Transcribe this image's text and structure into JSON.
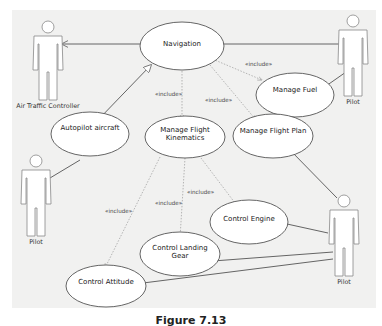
{
  "diagram": {
    "type": "uml-use-case",
    "actors": [
      {
        "id": "atc",
        "label": "Air Traffic Controller"
      },
      {
        "id": "pilot_top",
        "label": "Pilot"
      },
      {
        "id": "pilot_left",
        "label": "Pilot"
      },
      {
        "id": "pilot_bottom",
        "label": "Pilot"
      }
    ],
    "use_cases": [
      {
        "id": "navigation",
        "label": "Navigation"
      },
      {
        "id": "manage_fuel",
        "label": "Manage Fuel"
      },
      {
        "id": "autopilot",
        "label": "Autopilot aircraft"
      },
      {
        "id": "manage_flight_kinematics",
        "label_line1": "Manage Flight",
        "label_line2": "Kinematics"
      },
      {
        "id": "manage_flight_plan",
        "label": "Manage Flight Plan"
      },
      {
        "id": "control_engine",
        "label": "Control Engine"
      },
      {
        "id": "control_landing_gear",
        "label_line1": "Control Landing",
        "label_line2": "Gear"
      },
      {
        "id": "control_attitude",
        "label": "Control Attitude"
      }
    ],
    "relationships": [
      {
        "from": "navigation",
        "to": "atc",
        "type": "association-arrow"
      },
      {
        "from": "navigation",
        "to": "pilot_top",
        "type": "association"
      },
      {
        "from": "manage_fuel",
        "to": "pilot_top",
        "type": "association"
      },
      {
        "from": "autopilot",
        "to": "navigation",
        "type": "generalization"
      },
      {
        "from": "autopilot",
        "to": "pilot_left",
        "type": "association"
      },
      {
        "from": "navigation",
        "to": "manage_fuel",
        "type": "include",
        "label": "«include»"
      },
      {
        "from": "navigation",
        "to": "manage_flight_kinematics",
        "type": "include",
        "label": "«include»"
      },
      {
        "from": "navigation",
        "to": "manage_flight_plan",
        "type": "include",
        "label": "«include»"
      },
      {
        "from": "manage_flight_plan",
        "to": "pilot_bottom",
        "type": "association"
      },
      {
        "from": "manage_flight_kinematics",
        "to": "control_engine",
        "type": "include",
        "label": "«include»"
      },
      {
        "from": "manage_flight_kinematics",
        "to": "control_landing_gear",
        "type": "include",
        "label": "«include»"
      },
      {
        "from": "manage_flight_kinematics",
        "to": "control_attitude",
        "type": "include",
        "label": "«include»"
      },
      {
        "from": "control_engine",
        "to": "pilot_bottom",
        "type": "association"
      },
      {
        "from": "control_landing_gear",
        "to": "pilot_bottom",
        "type": "association"
      },
      {
        "from": "control_attitude",
        "to": "pilot_bottom",
        "type": "association"
      }
    ],
    "include_label": "«include»",
    "caption": "Figure 7.13"
  },
  "colors": {
    "background": "#f1f1f0",
    "line": "#555555",
    "dashed_line": "#888888",
    "shape_fill": "#ffffff"
  }
}
